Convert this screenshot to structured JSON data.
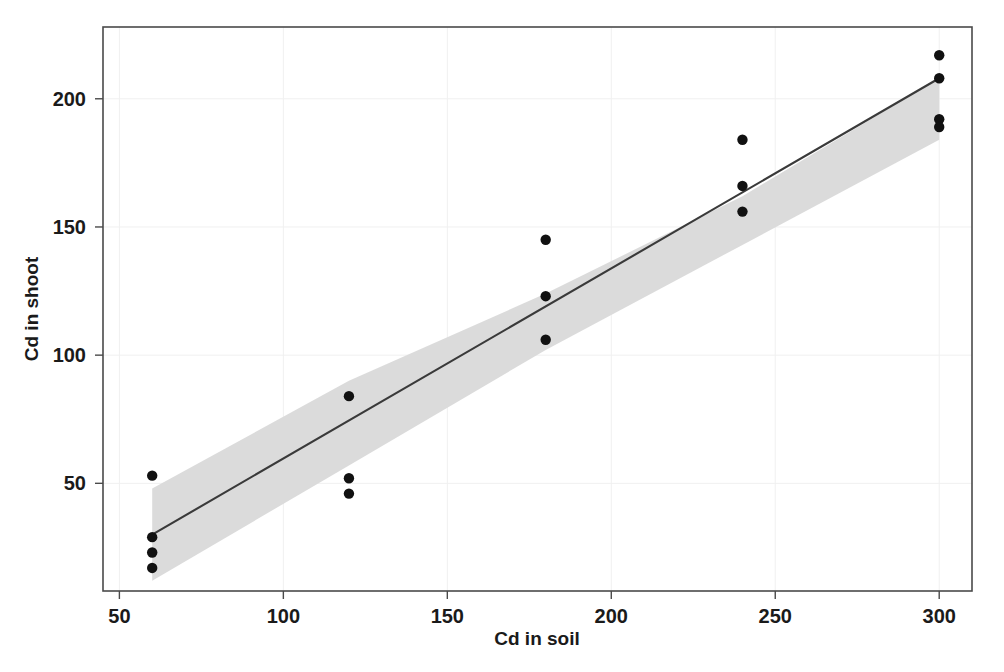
{
  "chart_data": {
    "type": "scatter",
    "title": "",
    "xlabel": "Cd in soil",
    "ylabel": "Cd in shoot",
    "xlim": [
      45,
      310
    ],
    "ylim": [
      8,
      228
    ],
    "xticks": [
      50,
      100,
      150,
      200,
      250,
      300
    ],
    "yticks": [
      50,
      100,
      150,
      200
    ],
    "xticklabels": [
      "50",
      "100",
      "150",
      "200",
      "250",
      "300"
    ],
    "yticklabels": [
      "50",
      "100",
      "150",
      "200"
    ],
    "grid": true,
    "legend": null,
    "series": [
      {
        "name": "observations",
        "marker": "filled-circle",
        "color": "#111111",
        "x": [
          60,
          60,
          60,
          60,
          120,
          120,
          120,
          180,
          180,
          180,
          240,
          240,
          240,
          300,
          300,
          300,
          300
        ],
        "y": [
          53,
          29,
          23,
          17,
          84,
          52,
          46,
          145,
          123,
          106,
          184,
          166,
          156,
          217,
          208,
          192,
          189
        ]
      },
      {
        "name": "regression-line",
        "type": "line",
        "color": "#3a3a3a",
        "x": [
          60,
          300
        ],
        "y": [
          30,
          208
        ]
      },
      {
        "name": "confidence-band",
        "type": "area",
        "color": "#d9d9d9",
        "x": [
          60,
          120,
          180,
          240,
          300
        ],
        "y_lower": [
          12,
          57,
          102,
          143,
          184
        ],
        "y_upper": [
          48,
          90,
          124,
          162,
          208
        ]
      }
    ],
    "annotations": []
  },
  "axes": {
    "x_title": "Cd in soil",
    "y_title": "Cd in shoot"
  }
}
